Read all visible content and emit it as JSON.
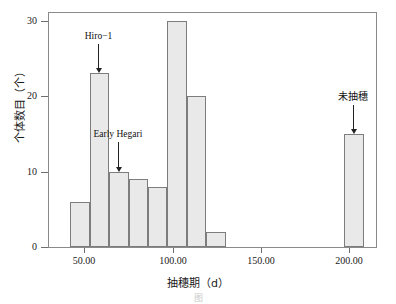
{
  "chart_data": {
    "type": "bar",
    "title": "",
    "subtitle": "",
    "xlabel": "抽穗期（d）",
    "ylabel": "个体数目（个）",
    "xlim": [
      30,
      215
    ],
    "ylim": [
      0,
      31
    ],
    "grid": false,
    "legend": null,
    "bin_width": 11,
    "categories": [
      "42-53",
      "53-64",
      "64-75",
      "75-86",
      "86-97",
      "97-108",
      "108-119",
      "119-130",
      "197-208"
    ],
    "bins": [
      {
        "start": 42,
        "end": 53,
        "value": 6
      },
      {
        "start": 53,
        "end": 64,
        "value": 23
      },
      {
        "start": 64,
        "end": 75,
        "value": 10
      },
      {
        "start": 75,
        "end": 86,
        "value": 9
      },
      {
        "start": 86,
        "end": 97,
        "value": 8
      },
      {
        "start": 97,
        "end": 108,
        "value": 30
      },
      {
        "start": 108,
        "end": 119,
        "value": 20
      },
      {
        "start": 119,
        "end": 130,
        "value": 2
      },
      {
        "start": 197,
        "end": 208,
        "value": 15
      }
    ],
    "values": [
      6,
      23,
      10,
      9,
      8,
      30,
      20,
      2,
      15
    ],
    "xticks": [
      {
        "value": 50,
        "label": "50.00"
      },
      {
        "value": 100,
        "label": "100.00"
      },
      {
        "value": 150,
        "label": "150.00"
      },
      {
        "value": 200,
        "label": "200.00"
      }
    ],
    "yticks": [
      {
        "value": 0,
        "label": "0"
      },
      {
        "value": 10,
        "label": "10"
      },
      {
        "value": 20,
        "label": "20"
      },
      {
        "value": 30,
        "label": "30"
      }
    ],
    "annotations": [
      {
        "text": "Hiro−1",
        "target_x": 58,
        "target_y": 23,
        "label_y_value": 28.6
      },
      {
        "text": "Early Hegari",
        "target_x": 69,
        "target_y": 10,
        "label_y_value": 15.6
      },
      {
        "text": "未抽穗",
        "target_x": 202,
        "target_y": 15,
        "label_y_value": 20.6
      }
    ],
    "bar_fill": "#e9e9e9",
    "bar_edge": "#7d7d7d",
    "axis_color": "#8a8a8a"
  },
  "caption": {
    "text": "图"
  }
}
